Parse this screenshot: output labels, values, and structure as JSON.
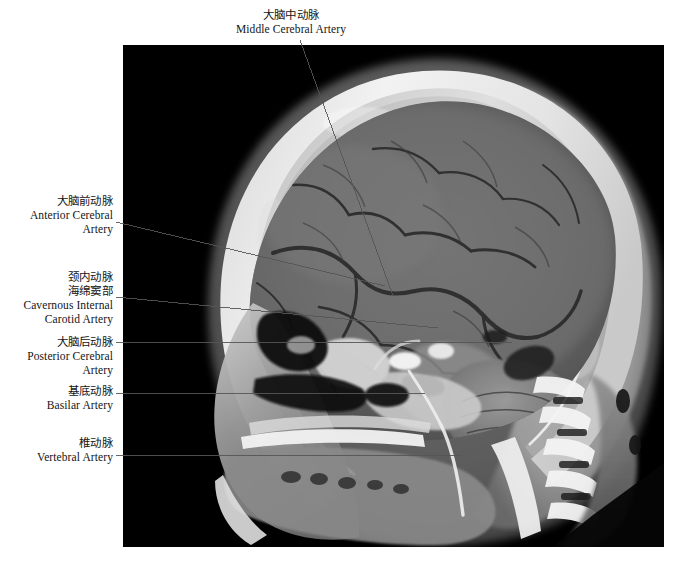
{
  "figure": {
    "type": "sagittal-cranial-angiographic-scan",
    "panel": {
      "x": 123,
      "y": 45,
      "width": 541,
      "height": 502,
      "background": "#000000"
    },
    "leader_color": "#555555"
  },
  "labels": [
    {
      "id": "middle-cerebral-artery",
      "zh": "大脑中动脉",
      "en": "Middle Cerebral Artery",
      "en_lines": [
        "Middle Cerebral Artery"
      ],
      "position": "top",
      "box": {
        "left": 216,
        "top": 8,
        "width": 150
      },
      "leader": {
        "x1": 300,
        "y1": 40,
        "x2": 393,
        "y2": 296
      }
    },
    {
      "id": "anterior-cerebral-artery",
      "zh": "大脑前动脉",
      "en": "Anterior Cerebral Artery",
      "en_lines": [
        "Anterior Cerebral",
        "Artery"
      ],
      "position": "left",
      "box": {
        "left": 0,
        "top": 194,
        "width": 113
      },
      "leader": {
        "x1": 116,
        "y1": 222,
        "x2": 385,
        "y2": 286
      }
    },
    {
      "id": "cavernous-internal-carotid-artery",
      "zh": "颈内动脉\n海绵窦部",
      "zh_lines": [
        "颈内动脉",
        "海绵窦部"
      ],
      "en": "Cavernous Internal Carotid Artery",
      "en_lines": [
        "Cavernous Internal",
        "Carotid Artery"
      ],
      "position": "left",
      "box": {
        "left": 0,
        "top": 270,
        "width": 113
      },
      "leader": {
        "x1": 116,
        "y1": 297,
        "x2": 438,
        "y2": 328
      }
    },
    {
      "id": "posterior-cerebral-artery",
      "zh": "大脑后动脉",
      "en": "Posterior Cerebral Artery",
      "en_lines": [
        "Posterior Cerebral",
        "Artery"
      ],
      "position": "left",
      "box": {
        "left": 0,
        "top": 335,
        "width": 113
      },
      "leader": {
        "x1": 116,
        "y1": 342,
        "x2": 512,
        "y2": 342
      }
    },
    {
      "id": "basilar-artery",
      "zh": "基底动脉",
      "en": "Basilar Artery",
      "en_lines": [
        "Basilar Artery"
      ],
      "position": "left",
      "box": {
        "left": 0,
        "top": 384,
        "width": 113
      },
      "leader": {
        "x1": 116,
        "y1": 393,
        "x2": 425,
        "y2": 393
      }
    },
    {
      "id": "vertebral-artery",
      "zh": "椎动脉",
      "en": "Vertebral Artery",
      "en_lines": [
        "Vertebral Artery"
      ],
      "position": "left",
      "box": {
        "left": 0,
        "top": 436,
        "width": 113
      },
      "leader": {
        "x1": 116,
        "y1": 455,
        "x2": 462,
        "y2": 455
      }
    }
  ]
}
